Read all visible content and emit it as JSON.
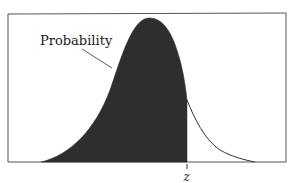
{
  "diagram": {
    "type": "normal-distribution-cdf-illustration",
    "annotation_label": "Probability",
    "axis_marker_label": "z",
    "colors": {
      "frame": "#555555",
      "shaded_area": "#2e2e2e",
      "curve": "#333333",
      "background": "#ffffff"
    }
  }
}
